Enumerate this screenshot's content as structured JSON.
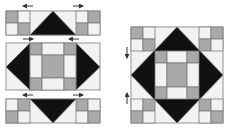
{
  "figure": {
    "colors": {
      "dark": "#111111",
      "gray": "#a9a9a9",
      "light": "#f2f2f2",
      "line": "#7a7a7a",
      "arrow": "#333333"
    },
    "left_panel": {
      "description": "Block assembled in three horizontal rows with pressing arrows",
      "rows": [
        "top strip",
        "center row",
        "bottom strip"
      ],
      "arrows": [
        {
          "row": "top",
          "side": "left",
          "direction": "left"
        },
        {
          "row": "top",
          "side": "right",
          "direction": "right"
        },
        {
          "row": "middle",
          "side": "left",
          "direction": "right"
        },
        {
          "row": "middle",
          "side": "right",
          "direction": "left"
        },
        {
          "row": "bottom",
          "side": "left",
          "direction": "left"
        },
        {
          "row": "bottom",
          "side": "right",
          "direction": "right"
        }
      ]
    },
    "right_panel": {
      "description": "Completed block with pressing arrows",
      "arrows": [
        {
          "side": "left",
          "position": "upper",
          "direction": "down"
        },
        {
          "side": "left",
          "position": "lower",
          "direction": "up"
        }
      ]
    }
  }
}
